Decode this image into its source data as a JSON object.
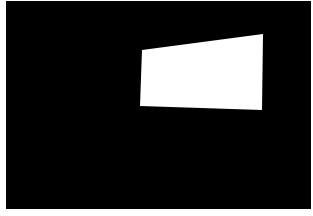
{
  "image": {
    "description": "Dark scene with a bright white quadrilateral panel (screen/window) viewed in perspective",
    "colors": {
      "background": "#000000",
      "border": "#ffffff",
      "panel": "#ffffff"
    },
    "panel_corners": {
      "top_left": [
        142,
        50
      ],
      "top_right": [
        263,
        34
      ],
      "bottom_right": [
        262,
        110
      ],
      "bottom_left": [
        140,
        106
      ]
    }
  }
}
